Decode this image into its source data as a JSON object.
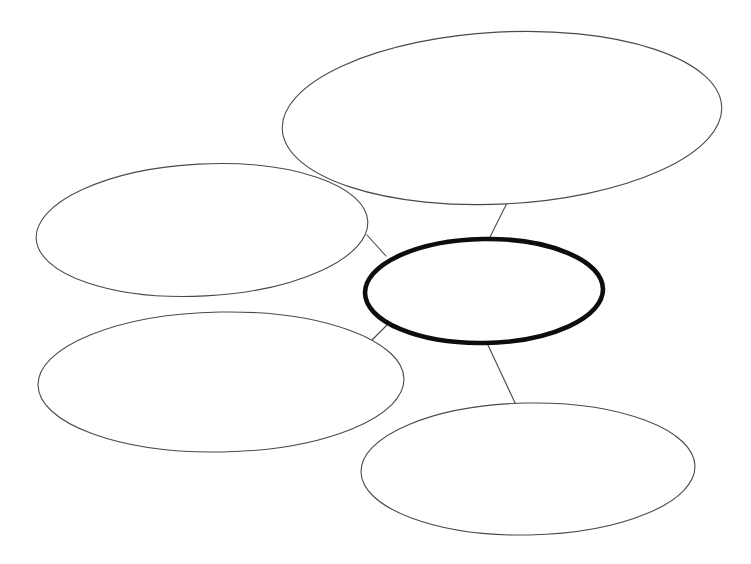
{
  "document": {
    "title": "Concept Map",
    "kind": "blank-bubble-concept-map",
    "background_color": "#ffffff",
    "canvas": {
      "width": 751,
      "height": 564
    }
  },
  "style": {
    "thin_stroke_color": "#4a4a4a",
    "thin_stroke_width": 1.1,
    "thick_stroke_color": "#0d0d0d",
    "thick_stroke_width": 4.6,
    "node_fill_color": "#ffffff",
    "connector_stroke_color": "#4a4a4a",
    "connector_stroke_width": 1.1
  },
  "diagram": {
    "central_node": {
      "id": "center",
      "role": "main-idea",
      "label": "",
      "emphasis": "thick",
      "cx": 484,
      "cy": 291,
      "rx": 119,
      "ry": 52,
      "rotate": -1
    },
    "satellite_nodes": [
      {
        "id": "node-top-right",
        "role": "supporting-idea",
        "label": "",
        "emphasis": "thin",
        "cx": 502,
        "cy": 118,
        "rx": 220,
        "ry": 86,
        "rotate": -3
      },
      {
        "id": "node-left-middle",
        "role": "supporting-idea",
        "label": "",
        "emphasis": "thin",
        "cx": 202,
        "cy": 230,
        "rx": 166,
        "ry": 66,
        "rotate": -3
      },
      {
        "id": "node-bottom-left",
        "role": "supporting-idea",
        "label": "",
        "emphasis": "thin",
        "cx": 221,
        "cy": 382,
        "rx": 183,
        "ry": 70,
        "rotate": -1
      },
      {
        "id": "node-bottom-right",
        "role": "supporting-idea",
        "label": "",
        "emphasis": "thin",
        "cx": 528,
        "cy": 469,
        "rx": 167,
        "ry": 66,
        "rotate": -1
      }
    ],
    "connectors": [
      {
        "id": "connector-center-to-top-right",
        "from": "center",
        "to": "node-top-right",
        "x1": 489,
        "y1": 239,
        "x2": 507,
        "y2": 203
      },
      {
        "id": "connector-center-to-left-middle",
        "from": "center",
        "to": "node-left-middle",
        "x1": 386,
        "y1": 256,
        "x2": 367,
        "y2": 235
      },
      {
        "id": "connector-center-to-bottom-left",
        "from": "center",
        "to": "node-bottom-left",
        "x1": 389,
        "y1": 323,
        "x2": 370,
        "y2": 342
      },
      {
        "id": "connector-center-to-bottom-right",
        "from": "center",
        "to": "node-bottom-right",
        "x1": 487,
        "y1": 343,
        "x2": 516,
        "y2": 405
      }
    ]
  }
}
